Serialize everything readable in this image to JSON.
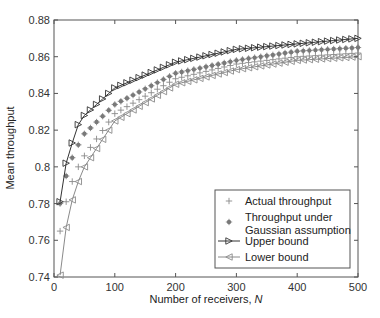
{
  "chart_data": {
    "type": "line",
    "title": "",
    "xlabel": "Number of receivers, ",
    "xlabel_italic": "N",
    "ylabel": "Mean throughput",
    "xlim": [
      0,
      500
    ],
    "ylim": [
      0.74,
      0.88
    ],
    "xticks": [
      0,
      100,
      200,
      300,
      400,
      500
    ],
    "xtick_labels": [
      "0",
      "100",
      "200",
      "300",
      "400",
      "500"
    ],
    "yticks": [
      0.74,
      0.76,
      0.78,
      0.8,
      0.82,
      0.84,
      0.86,
      0.88
    ],
    "ytick_labels": [
      "0.74",
      "0.76",
      "0.78",
      "0.8",
      "0.82",
      "0.84",
      "0.86",
      "0.88"
    ],
    "grid": false,
    "legend_position": "lower right",
    "x": [
      10,
      20,
      30,
      40,
      50,
      100,
      200,
      300,
      400,
      500
    ],
    "series": [
      {
        "name": "Actual throughput",
        "marker": "plus",
        "line": false,
        "color": "#8a8a8a",
        "values": [
          0.765,
          0.781,
          0.792,
          0.8,
          0.806,
          0.829,
          0.848,
          0.856,
          0.86,
          0.862
        ]
      },
      {
        "name": "Throughput under Gaussian assumption",
        "marker": "asterisk",
        "line": false,
        "color": "#7a7a7a",
        "values": [
          0.78,
          0.795,
          0.805,
          0.812,
          0.818,
          0.834,
          0.851,
          0.858,
          0.863,
          0.865
        ]
      },
      {
        "name": "Upper bound",
        "marker": "triangle-right",
        "line": true,
        "color": "#333333",
        "values": [
          0.781,
          0.802,
          0.813,
          0.823,
          0.828,
          0.843,
          0.857,
          0.864,
          0.867,
          0.87
        ]
      },
      {
        "name": "Lower bound",
        "marker": "triangle-left",
        "line": true,
        "color": "#8a8a8a",
        "values": [
          0.741,
          0.767,
          0.782,
          0.792,
          0.8,
          0.825,
          0.845,
          0.853,
          0.858,
          0.86
        ]
      }
    ]
  },
  "legend": {
    "items": [
      {
        "label_lines": [
          "Actual throughput"
        ]
      },
      {
        "label_lines": [
          "Throughput under",
          "Gaussian assumption"
        ]
      },
      {
        "label_lines": [
          "Upper bound"
        ]
      },
      {
        "label_lines": [
          "Lower bound"
        ]
      }
    ]
  }
}
